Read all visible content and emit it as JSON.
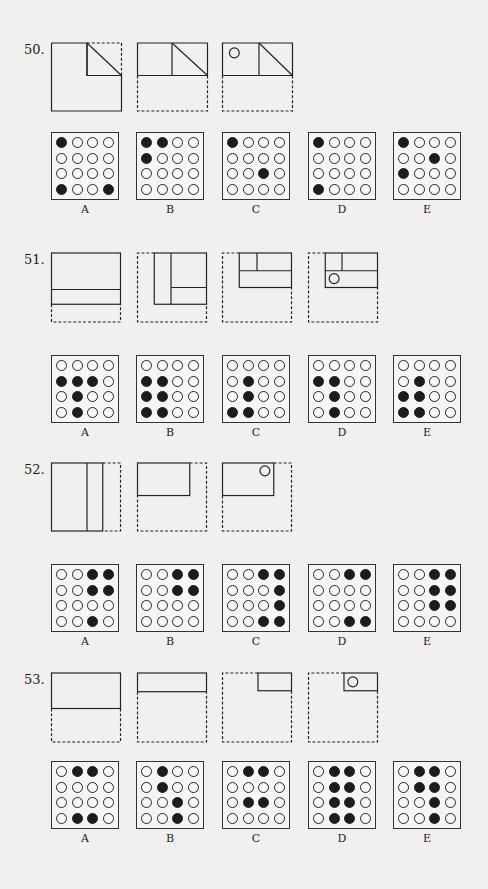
{
  "problems": [
    {
      "number": "50.",
      "top": 40,
      "folds": [
        {
          "shapes": [
            {
              "t": "poly",
              "d": false,
              "pts": "0,0 36,0 36,33 71,33 71,69 0,69 0,0"
            },
            {
              "t": "poly",
              "d": false,
              "pts": "36,0 36,33 71,33"
            },
            {
              "t": "line",
              "d": false,
              "x1": 36,
              "y1": 0,
              "x2": 71,
              "y2": 33
            },
            {
              "t": "poly",
              "d": true,
              "pts": "36,0 71,0 71,33"
            }
          ]
        },
        {
          "shapes": [
            {
              "t": "poly",
              "d": false,
              "pts": "0,33 0,0 71,0 71,33 0,33"
            },
            {
              "t": "line",
              "d": false,
              "x1": 35,
              "y1": 0,
              "x2": 35,
              "y2": 33
            },
            {
              "t": "line",
              "d": false,
              "x1": 35,
              "y1": 0,
              "x2": 71,
              "y2": 33
            },
            {
              "t": "poly",
              "d": true,
              "pts": "0,33 0,69 71,69 71,33"
            }
          ]
        },
        {
          "shapes": [
            {
              "t": "poly",
              "d": false,
              "pts": "0,33 0,0 71,0 71,33 0,33"
            },
            {
              "t": "line",
              "d": false,
              "x1": 37,
              "y1": 0,
              "x2": 37,
              "y2": 33
            },
            {
              "t": "line",
              "d": false,
              "x1": 37,
              "y1": 0,
              "x2": 71,
              "y2": 33
            },
            {
              "t": "poly",
              "d": true,
              "pts": "0,33 0,69 71,69 71,33"
            },
            {
              "t": "circle",
              "cx": 12,
              "cy": 10,
              "r": 5
            }
          ]
        }
      ],
      "choices_top": 92,
      "choices": [
        {
          "label": "A",
          "dots": [
            [
              1,
              0,
              0,
              0
            ],
            [
              0,
              0,
              0,
              0
            ],
            [
              0,
              0,
              0,
              0
            ],
            [
              1,
              0,
              0,
              1
            ]
          ]
        },
        {
          "label": "B",
          "dots": [
            [
              1,
              1,
              0,
              0
            ],
            [
              1,
              0,
              0,
              0
            ],
            [
              0,
              0,
              0,
              0
            ],
            [
              0,
              0,
              0,
              0
            ]
          ]
        },
        {
          "label": "C",
          "dots": [
            [
              1,
              0,
              0,
              0
            ],
            [
              0,
              0,
              0,
              0
            ],
            [
              0,
              0,
              1,
              0
            ],
            [
              0,
              0,
              0,
              0
            ]
          ]
        },
        {
          "label": "D",
          "dots": [
            [
              1,
              0,
              0,
              0
            ],
            [
              0,
              0,
              0,
              0
            ],
            [
              0,
              0,
              0,
              0
            ],
            [
              1,
              0,
              0,
              0
            ]
          ]
        },
        {
          "label": "E",
          "dots": [
            [
              1,
              0,
              0,
              0
            ],
            [
              0,
              0,
              1,
              0
            ],
            [
              1,
              0,
              0,
              0
            ],
            [
              0,
              0,
              0,
              0
            ]
          ]
        }
      ]
    },
    {
      "number": "51.",
      "top": 250,
      "folds": [
        {
          "shapes": [
            {
              "t": "rect",
              "d": false,
              "x": 0,
              "y": 0,
              "w": 70,
              "h": 52
            },
            {
              "t": "line",
              "d": false,
              "x1": 0,
              "y1": 37,
              "x2": 70,
              "y2": 37
            },
            {
              "t": "poly",
              "d": true,
              "pts": "0,52 0,70 70,70 70,52"
            }
          ]
        },
        {
          "shapes": [
            {
              "t": "poly",
              "d": true,
              "pts": "17,0 0,0 0,70 70,70 70,52"
            },
            {
              "t": "rect",
              "d": false,
              "x": 17,
              "y": 0,
              "w": 53,
              "h": 52
            },
            {
              "t": "line",
              "d": false,
              "x1": 34,
              "y1": 0,
              "x2": 34,
              "y2": 52
            },
            {
              "t": "line",
              "d": false,
              "x1": 34,
              "y1": 35,
              "x2": 70,
              "y2": 35
            }
          ]
        },
        {
          "shapes": [
            {
              "t": "poly",
              "d": true,
              "pts": "17,0 0,0 0,70 70,70 70,35"
            },
            {
              "t": "rect",
              "d": false,
              "x": 17,
              "y": 0,
              "w": 53,
              "h": 35
            },
            {
              "t": "line",
              "d": false,
              "x1": 35,
              "y1": 0,
              "x2": 35,
              "y2": 18
            },
            {
              "t": "line",
              "d": false,
              "x1": 17,
              "y1": 18,
              "x2": 70,
              "y2": 18
            }
          ]
        },
        {
          "shapes": [
            {
              "t": "poly",
              "d": true,
              "pts": "17,0 0,0 0,70 70,70 70,35"
            },
            {
              "t": "rect",
              "d": false,
              "x": 17,
              "y": 0,
              "w": 53,
              "h": 35
            },
            {
              "t": "line",
              "d": false,
              "x1": 34,
              "y1": 0,
              "x2": 34,
              "y2": 18
            },
            {
              "t": "line",
              "d": false,
              "x1": 17,
              "y1": 18,
              "x2": 70,
              "y2": 18
            },
            {
              "t": "circle",
              "cx": 26,
              "cy": 26,
              "r": 5
            }
          ]
        }
      ],
      "choices_top": 105,
      "choices": [
        {
          "label": "A",
          "dots": [
            [
              0,
              0,
              0,
              0
            ],
            [
              1,
              1,
              1,
              0
            ],
            [
              0,
              1,
              0,
              0
            ],
            [
              0,
              1,
              0,
              0
            ]
          ]
        },
        {
          "label": "B",
          "dots": [
            [
              0,
              0,
              0,
              0
            ],
            [
              1,
              1,
              0,
              0
            ],
            [
              1,
              1,
              0,
              0
            ],
            [
              1,
              1,
              0,
              0
            ]
          ]
        },
        {
          "label": "C",
          "dots": [
            [
              0,
              0,
              0,
              0
            ],
            [
              0,
              1,
              0,
              0
            ],
            [
              0,
              1,
              0,
              0
            ],
            [
              1,
              1,
              0,
              0
            ]
          ]
        },
        {
          "label": "D",
          "dots": [
            [
              0,
              0,
              0,
              0
            ],
            [
              1,
              1,
              0,
              0
            ],
            [
              0,
              1,
              0,
              0
            ],
            [
              0,
              1,
              0,
              0
            ]
          ]
        },
        {
          "label": "E",
          "dots": [
            [
              0,
              0,
              0,
              0
            ],
            [
              0,
              1,
              0,
              0
            ],
            [
              1,
              1,
              0,
              0
            ],
            [
              1,
              1,
              0,
              0
            ]
          ]
        }
      ]
    },
    {
      "number": "52.",
      "top": 460,
      "folds": [
        {
          "shapes": [
            {
              "t": "rect",
              "d": false,
              "x": 0,
              "y": 0,
              "w": 52,
              "h": 69
            },
            {
              "t": "line",
              "d": false,
              "x1": 36,
              "y1": 0,
              "x2": 36,
              "y2": 69
            },
            {
              "t": "poly",
              "d": true,
              "pts": "52,0 70,0 70,69 52,69"
            }
          ]
        },
        {
          "shapes": [
            {
              "t": "rect",
              "d": false,
              "x": 0,
              "y": 0,
              "w": 53,
              "h": 33
            },
            {
              "t": "poly",
              "d": true,
              "pts": "53,0 70,0 70,69 0,69 0,33"
            }
          ]
        },
        {
          "shapes": [
            {
              "t": "rect",
              "d": false,
              "x": 0,
              "y": 0,
              "w": 52,
              "h": 33
            },
            {
              "t": "poly",
              "d": true,
              "pts": "52,0 70,0 70,69 0,69 0,33"
            },
            {
              "t": "circle",
              "cx": 43,
              "cy": 8,
              "r": 5
            }
          ]
        }
      ],
      "choices_top": 104,
      "choices": [
        {
          "label": "A",
          "dots": [
            [
              0,
              0,
              1,
              1
            ],
            [
              0,
              0,
              1,
              1
            ],
            [
              0,
              0,
              0,
              0
            ],
            [
              0,
              0,
              1,
              0
            ]
          ]
        },
        {
          "label": "B",
          "dots": [
            [
              0,
              0,
              1,
              1
            ],
            [
              0,
              0,
              1,
              1
            ],
            [
              0,
              0,
              0,
              0
            ],
            [
              0,
              0,
              0,
              0
            ]
          ]
        },
        {
          "label": "C",
          "dots": [
            [
              0,
              0,
              1,
              1
            ],
            [
              0,
              0,
              0,
              1
            ],
            [
              0,
              0,
              0,
              1
            ],
            [
              0,
              0,
              1,
              1
            ]
          ]
        },
        {
          "label": "D",
          "dots": [
            [
              0,
              0,
              1,
              1
            ],
            [
              0,
              0,
              0,
              0
            ],
            [
              0,
              0,
              0,
              0
            ],
            [
              0,
              0,
              1,
              1
            ]
          ]
        },
        {
          "label": "E",
          "dots": [
            [
              0,
              0,
              1,
              1
            ],
            [
              0,
              0,
              1,
              1
            ],
            [
              0,
              0,
              1,
              1
            ],
            [
              0,
              0,
              0,
              0
            ]
          ]
        }
      ]
    },
    {
      "number": "53.",
      "top": 670,
      "folds": [
        {
          "shapes": [
            {
              "t": "rect",
              "d": false,
              "x": 0,
              "y": 0,
              "w": 70,
              "h": 36
            },
            {
              "t": "poly",
              "d": true,
              "pts": "0,36 0,70 70,70 70,36"
            }
          ]
        },
        {
          "shapes": [
            {
              "t": "rect",
              "d": false,
              "x": 0,
              "y": 0,
              "w": 70,
              "h": 19
            },
            {
              "t": "poly",
              "d": true,
              "pts": "0,19 0,70 70,70 70,19"
            }
          ]
        },
        {
          "shapes": [
            {
              "t": "rect",
              "d": false,
              "x": 36,
              "y": 0,
              "w": 34,
              "h": 18
            },
            {
              "t": "poly",
              "d": true,
              "pts": "36,0 0,0 0,70 70,70 70,18"
            }
          ]
        },
        {
          "shapes": [
            {
              "t": "rect",
              "d": false,
              "x": 36,
              "y": 0,
              "w": 34,
              "h": 18
            },
            {
              "t": "poly",
              "d": true,
              "pts": "36,0 0,0 0,70 70,70 70,18"
            },
            {
              "t": "circle",
              "cx": 45,
              "cy": 9,
              "r": 5
            }
          ]
        }
      ],
      "choices_top": 91,
      "choices": [
        {
          "label": "A",
          "dots": [
            [
              0,
              1,
              1,
              0
            ],
            [
              0,
              0,
              0,
              0
            ],
            [
              0,
              0,
              0,
              0
            ],
            [
              0,
              1,
              1,
              0
            ]
          ]
        },
        {
          "label": "B",
          "dots": [
            [
              0,
              1,
              0,
              0
            ],
            [
              0,
              1,
              0,
              0
            ],
            [
              0,
              0,
              1,
              0
            ],
            [
              0,
              0,
              1,
              0
            ]
          ]
        },
        {
          "label": "C",
          "dots": [
            [
              0,
              1,
              1,
              0
            ],
            [
              0,
              0,
              0,
              0
            ],
            [
              0,
              1,
              1,
              0
            ],
            [
              0,
              0,
              0,
              0
            ]
          ]
        },
        {
          "label": "D",
          "dots": [
            [
              0,
              1,
              1,
              0
            ],
            [
              0,
              1,
              1,
              0
            ],
            [
              0,
              1,
              1,
              0
            ],
            [
              0,
              1,
              1,
              0
            ]
          ]
        },
        {
          "label": "E",
          "dots": [
            [
              0,
              1,
              1,
              0
            ],
            [
              0,
              1,
              1,
              0
            ],
            [
              0,
              0,
              1,
              0
            ],
            [
              0,
              0,
              1,
              0
            ]
          ]
        }
      ]
    }
  ],
  "layout": {
    "fold_x": [
      51,
      137,
      222,
      308
    ],
    "choice_x": [
      51,
      136,
      222,
      308,
      393
    ]
  },
  "colors": {
    "ink": "#222222",
    "paper": "#f1f0ee",
    "filled_dot": "#1c1c1c"
  }
}
